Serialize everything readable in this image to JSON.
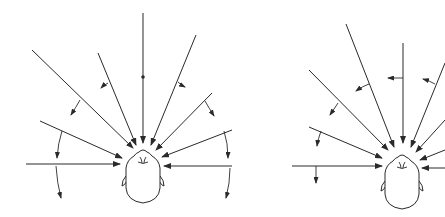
{
  "figure": {
    "colors": {
      "line": "#2a2a2a",
      "background": "#ffffff"
    },
    "panels": [
      {
        "id": "left",
        "head_center": [
          143,
          175
        ],
        "rays": [
          {
            "from": [
              143,
              13
            ],
            "to": [
              143,
              143
            ]
          },
          {
            "from": [
              32,
              50
            ],
            "to": [
              133,
              148
            ]
          },
          {
            "from": [
              98,
              53
            ],
            "to": [
              136,
              145
            ]
          },
          {
            "from": [
              196,
              35
            ],
            "to": [
              151,
              145
            ]
          },
          {
            "from": [
              212,
              93
            ],
            "to": [
              156,
              150
            ]
          },
          {
            "from": [
              40,
              121
            ],
            "to": [
              122,
              158
            ]
          },
          {
            "from": [
              26,
              164
            ],
            "to": [
              120,
              164
            ]
          },
          {
            "from": [
              232,
              130
            ],
            "to": [
              162,
              157
            ]
          },
          {
            "from": [
              232,
              166
            ],
            "to": [
              164,
              166
            ]
          }
        ],
        "center_marker": [
          143,
          77
        ]
      },
      {
        "id": "right",
        "head_center": [
          402,
          182
        ],
        "rays": [
          {
            "from": [
              403,
              43
            ],
            "to": [
              403,
              143
            ]
          },
          {
            "from": [
              346,
              24
            ],
            "to": [
              394,
              147
            ]
          },
          {
            "from": [
              309,
              70
            ],
            "to": [
              388,
              150
            ]
          },
          {
            "from": [
              309,
              127
            ],
            "to": [
              382,
              158
            ]
          },
          {
            "from": [
              292,
              166
            ],
            "to": [
              382,
              166
            ]
          },
          {
            "from": [
              445,
              63
            ],
            "to": [
              411,
              147
            ]
          },
          {
            "from": [
              445,
              120
            ],
            "to": [
              416,
              152
            ]
          },
          {
            "from": [
              445,
              150
            ],
            "to": [
              420,
              160
            ]
          },
          {
            "from": [
              445,
              168
            ],
            "to": [
              422,
              168
            ]
          }
        ]
      }
    ]
  }
}
